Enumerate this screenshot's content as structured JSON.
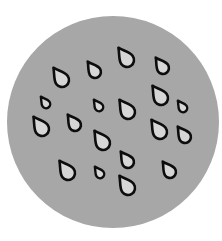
{
  "icon": {
    "name": "rain-drops-icon",
    "colors": {
      "background": "#ffffff",
      "disc": "#a7a7a7",
      "drop_fill": "#d6d6d6",
      "drop_stroke": "#0d0d0d"
    },
    "disc": {
      "cx": 113,
      "cy": 122,
      "r": 106
    },
    "drops": [
      {
        "x": 127,
        "y": 60,
        "s": 1.0
      },
      {
        "x": 95,
        "y": 72,
        "s": 0.85
      },
      {
        "x": 62,
        "y": 80,
        "s": 1.0
      },
      {
        "x": 163,
        "y": 68,
        "s": 0.85
      },
      {
        "x": 46,
        "y": 104,
        "s": 0.6
      },
      {
        "x": 99,
        "y": 107,
        "s": 0.6
      },
      {
        "x": 128,
        "y": 112,
        "s": 1.0
      },
      {
        "x": 161,
        "y": 98,
        "s": 1.0
      },
      {
        "x": 183,
        "y": 108,
        "s": 0.6
      },
      {
        "x": 42,
        "y": 129,
        "s": 1.0
      },
      {
        "x": 75,
        "y": 125,
        "s": 0.85
      },
      {
        "x": 103,
        "y": 143,
        "s": 1.0
      },
      {
        "x": 160,
        "y": 132,
        "s": 1.0
      },
      {
        "x": 185,
        "y": 137,
        "s": 0.85
      },
      {
        "x": 128,
        "y": 162,
        "s": 0.85
      },
      {
        "x": 68,
        "y": 173,
        "s": 1.0
      },
      {
        "x": 100,
        "y": 174,
        "s": 0.6
      },
      {
        "x": 128,
        "y": 188,
        "s": 1.0
      },
      {
        "x": 170,
        "y": 172,
        "s": 0.85
      }
    ]
  }
}
